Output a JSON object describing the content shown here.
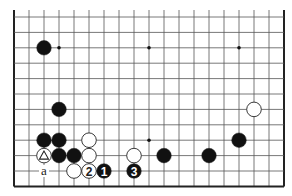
{
  "diagram": {
    "type": "go-board-fragment",
    "grid": {
      "cols": 19,
      "rows": 12,
      "origin_x": 14,
      "origin_y": 17,
      "spacing_x": 15,
      "spacing_y": 15.4,
      "edges": {
        "left": true,
        "right": true,
        "bottom": true,
        "top": false
      }
    },
    "star_points": [
      {
        "col": 3,
        "row": 2
      },
      {
        "col": 9,
        "row": 2
      },
      {
        "col": 15,
        "row": 2
      },
      {
        "col": 9,
        "row": 8
      }
    ],
    "stones": [
      {
        "color": "black",
        "col": 2,
        "row": 2
      },
      {
        "color": "black",
        "col": 3,
        "row": 6
      },
      {
        "color": "black",
        "col": 2,
        "row": 8
      },
      {
        "color": "black",
        "col": 3,
        "row": 8
      },
      {
        "color": "white",
        "col": 5,
        "row": 8
      },
      {
        "color": "white",
        "col": 2,
        "row": 9,
        "mark": "triangle"
      },
      {
        "color": "black",
        "col": 3,
        "row": 9
      },
      {
        "color": "black",
        "col": 4,
        "row": 9
      },
      {
        "color": "white",
        "col": 5,
        "row": 9
      },
      {
        "color": "white",
        "col": 8,
        "row": 9
      },
      {
        "color": "white",
        "col": 4,
        "row": 10
      },
      {
        "color": "white",
        "col": 5,
        "row": 10,
        "label": "2"
      },
      {
        "color": "black",
        "col": 6,
        "row": 10,
        "label": "1"
      },
      {
        "color": "black",
        "col": 8,
        "row": 10,
        "label": "3"
      },
      {
        "color": "white",
        "col": 16,
        "row": 6
      },
      {
        "color": "black",
        "col": 15,
        "row": 8
      },
      {
        "color": "black",
        "col": 10,
        "row": 9
      },
      {
        "color": "black",
        "col": 13,
        "row": 9
      }
    ],
    "letters": [
      {
        "text": "a",
        "col": 2,
        "row": 10
      }
    ],
    "colors": {
      "line": "#555555",
      "edge": "#222222",
      "black_stone": "#111111",
      "white_stone": "#ffffff",
      "background": "#ffffff"
    }
  }
}
